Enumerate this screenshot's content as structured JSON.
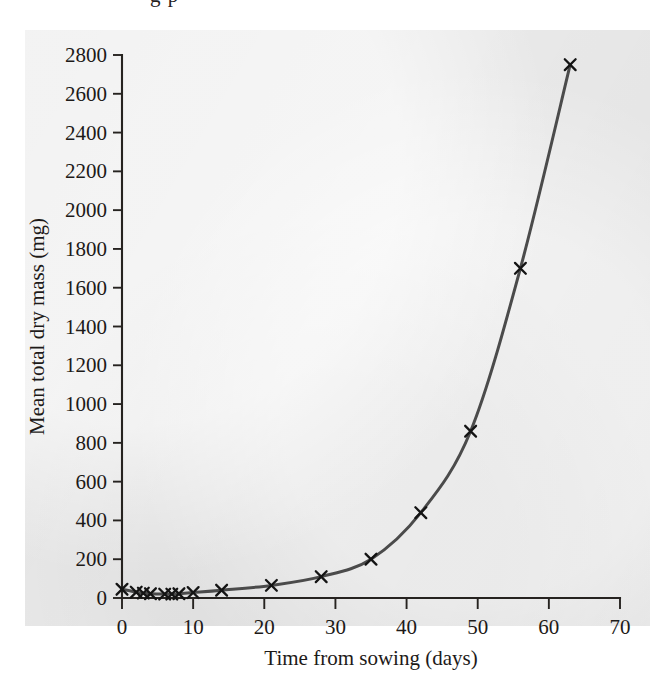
{
  "figure": {
    "caption_fragment_above": "g p",
    "background_color": "#e9e9e9",
    "page_color": "#ffffff",
    "curve_color": "#4b4b4b",
    "marker_color": "#141414",
    "axis_color": "#262320"
  },
  "chart_data": {
    "type": "line",
    "title": "",
    "xlabel": "Time from sowing (days)",
    "ylabel": "Mean total dry mass (mg)",
    "xlim": [
      0,
      70
    ],
    "ylim": [
      0,
      2800
    ],
    "xticks": [
      0,
      10,
      20,
      30,
      40,
      50,
      60,
      70
    ],
    "xtick_labels": [
      "0",
      "10",
      "20",
      "30",
      "40",
      "50",
      "60",
      "70"
    ],
    "yticks": [
      0,
      200,
      400,
      600,
      800,
      1000,
      1200,
      1400,
      1600,
      1800,
      2000,
      2200,
      2400,
      2600,
      2800
    ],
    "ytick_labels": [
      "0",
      "200",
      "400",
      "600",
      "800",
      "1000",
      "1200",
      "1400",
      "1600",
      "1800",
      "2000",
      "2200",
      "2400",
      "2600",
      "2800"
    ],
    "grid": false,
    "legend": null,
    "marker_style": "x",
    "series": [
      {
        "name": "Mean total dry mass",
        "x": [
          0,
          2,
          3,
          4,
          6,
          7,
          8,
          10,
          14,
          21,
          28,
          35,
          42,
          49,
          56,
          63
        ],
        "y": [
          45,
          30,
          25,
          22,
          20,
          20,
          22,
          28,
          40,
          65,
          110,
          200,
          440,
          860,
          1700,
          2750
        ]
      }
    ]
  }
}
